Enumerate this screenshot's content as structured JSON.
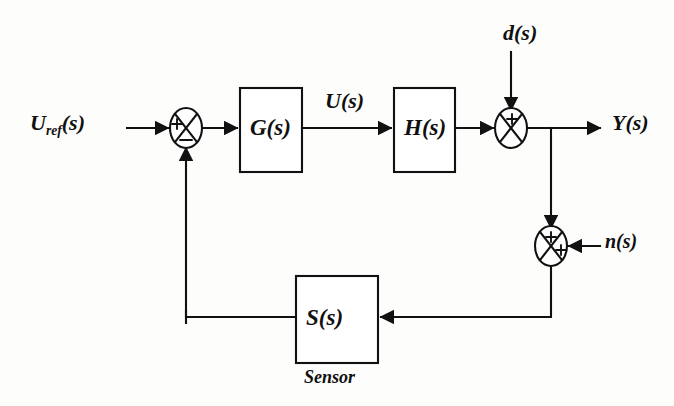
{
  "diagram": {
    "stroke_color": "#111111",
    "background_color": "#fdfdfc",
    "blocks": [
      {
        "id": "G",
        "label": "G(s)",
        "x": 240,
        "y": 88,
        "w": 62,
        "h": 84
      },
      {
        "id": "H",
        "label": "H(s)",
        "x": 394,
        "y": 88,
        "w": 61,
        "h": 84
      },
      {
        "id": "S",
        "label": "S(s)",
        "x": 296,
        "y": 276,
        "w": 82,
        "h": 87,
        "caption": "Sensor"
      }
    ],
    "summing_junctions": [
      {
        "id": "sum1",
        "cx": 186,
        "cy": 128,
        "rx": 16,
        "ry": 20,
        "signs": {
          "left": "+",
          "bottom": "−"
        }
      },
      {
        "id": "sum2",
        "cx": 511,
        "cy": 128,
        "rx": 16,
        "ry": 20,
        "signs": {
          "top": "+",
          "left": "+"
        }
      },
      {
        "id": "sum3",
        "cx": 551,
        "cy": 246,
        "rx": 16,
        "ry": 20,
        "signs": {
          "top": "+",
          "right": "+"
        }
      }
    ],
    "signal_labels": [
      {
        "id": "uref",
        "text": "U",
        "subscript": "ref",
        "suffix": "(s)",
        "x": 30,
        "y": 115
      },
      {
        "id": "u",
        "text": "U(s)",
        "x": 325,
        "y": 93
      },
      {
        "id": "y",
        "text": "Y(s)",
        "x": 612,
        "y": 115
      },
      {
        "id": "d",
        "text": "d(s)",
        "x": 503,
        "y": 25
      },
      {
        "id": "n",
        "text": "n(s)",
        "x": 605,
        "y": 233
      }
    ],
    "sensor_caption": "Sensor"
  }
}
